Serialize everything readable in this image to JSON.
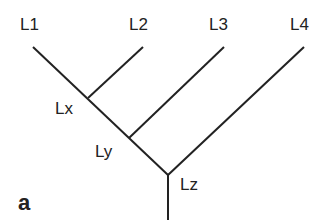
{
  "diagram": {
    "type": "tree",
    "panel_label": "a",
    "leaves": [
      {
        "label": "L1"
      },
      {
        "label": "L2"
      },
      {
        "label": "L3"
      },
      {
        "label": "L4"
      }
    ],
    "internal_nodes": [
      {
        "label": "Lx",
        "children": [
          "L1",
          "L2"
        ]
      },
      {
        "label": "Ly",
        "children": [
          "Lx",
          "L3"
        ]
      },
      {
        "label": "Lz",
        "children": [
          "Ly",
          "L4"
        ]
      }
    ],
    "line_color": "#222222"
  }
}
